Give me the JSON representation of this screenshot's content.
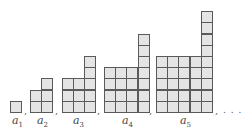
{
  "figures": [
    {
      "label": "a",
      "index": "1",
      "columns": [
        1
      ],
      "x": 10,
      "label_x": 12
    },
    {
      "label": "a",
      "index": "2",
      "columns": [
        2,
        3
      ],
      "x": 30,
      "label_x": 37
    },
    {
      "label": "a",
      "index": "3",
      "columns": [
        3,
        3,
        5
      ],
      "x": 62,
      "label_x": 73
    },
    {
      "label": "a",
      "index": "4",
      "columns": [
        4,
        4,
        4,
        7
      ],
      "x": 104,
      "label_x": 122
    },
    {
      "label": "a",
      "index": "5",
      "columns": [
        5,
        5,
        5,
        5,
        9
      ],
      "x": 156,
      "label_x": 180
    }
  ],
  "separator": ",",
  "ellipsis": ". . .",
  "colors": {
    "cell_fill": "#e4e4e4",
    "cell_border": "#5a5a5a"
  }
}
